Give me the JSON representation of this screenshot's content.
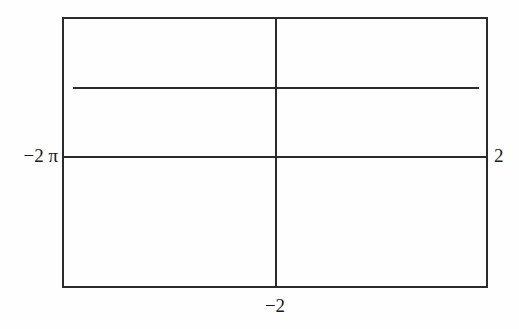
{
  "figure": {
    "background_color": "#fefefe",
    "line_color": "#2b2b2b",
    "text_color": "#1a1a1a"
  },
  "labels": {
    "y_axis_label": "−2 π",
    "right_label": "2",
    "x_axis_label": "−2"
  },
  "chart_data": {
    "type": "line",
    "title": "",
    "xlabel": "",
    "ylabel": "",
    "grid": false,
    "legend": "none",
    "axes": {
      "vertical_axis_x": -2,
      "horizontal_axis_y": -6.283185,
      "horizontal_axis_y_label": "−2 π",
      "right_edge_label": "2",
      "bottom_tick_label": "−2"
    },
    "frame": {
      "x_px": [
        62,
        488
      ],
      "y_px": [
        17,
        288
      ]
    },
    "series": [
      {
        "name": "horizontal-segment",
        "kind": "constant",
        "x": [
          -2.85,
          2.65
        ],
        "values": [
          -4.2,
          -4.2
        ],
        "description": "straight horizontal line above the horizontal axis"
      }
    ],
    "xlim": [
      -3,
      2.8
    ],
    "ylim": [
      -12.5,
      2.0
    ],
    "tick_labels": {
      "x": [
        "−2"
      ],
      "y": [
        "−2 π"
      ]
    },
    "annotations": [
      "2"
    ]
  }
}
